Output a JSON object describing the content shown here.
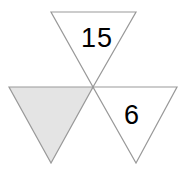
{
  "figure": {
    "name": "three-triangles-at-shared-vertex",
    "canvas": {
      "width": 185,
      "height": 172,
      "background": "#ffffff"
    },
    "shared_vertex": {
      "x": 93,
      "y": 87
    },
    "stroke_color": "#999999",
    "white_fill": "#ffffff",
    "shaded_fill": "#e4e4e4",
    "triangles": [
      {
        "id": "top",
        "label": "15",
        "shaded": false,
        "fill": "#ffffff",
        "points": "51,12 136,12 93,87",
        "label_x": 97,
        "label_y": 40
      },
      {
        "id": "left",
        "label": "",
        "shaded": true,
        "fill": "#e4e4e4",
        "points": "9,87 93,87 51,163",
        "label_x": 51,
        "label_y": 115
      },
      {
        "id": "right",
        "label": "6",
        "shaded": false,
        "fill": "#ffffff",
        "points": "93,87 177,87 136,163",
        "label_x": 132,
        "label_y": 117
      }
    ]
  }
}
